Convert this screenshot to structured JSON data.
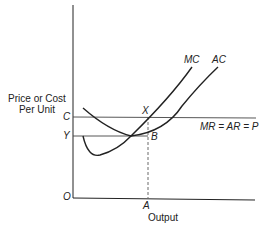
{
  "diagram": {
    "title": "",
    "y_axis_label_line1": "Price or Cost",
    "y_axis_label_line2": "Per Unit",
    "x_axis_label": "Output",
    "origin_label": "O",
    "curves": {
      "mc_label": "MC",
      "ac_label": "AC"
    },
    "price_line_label": "MR = AR = P",
    "points": {
      "c": "C",
      "y": "Y",
      "x": "X",
      "b": "B",
      "a": "A"
    },
    "colors": {
      "line": "#222222",
      "background": "#ffffff"
    }
  }
}
